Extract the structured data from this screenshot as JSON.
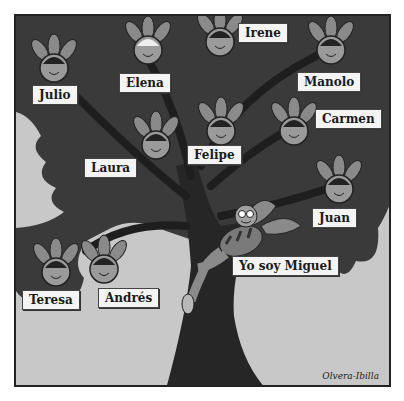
{
  "illustration": {
    "title": "Family tree",
    "colors": {
      "sky": "#c8c8c8",
      "foliage": "#3a3a3a",
      "trunk": "#2a2a2a",
      "leaf": "#8a8a8a",
      "face": "#9a9a9a",
      "label_bg": "#f4f4f4"
    },
    "members": [
      {
        "name": "Julio",
        "face": {
          "cx": 38,
          "cy": 52
        },
        "label": {
          "x": 16,
          "y": 69
        }
      },
      {
        "name": "Elena",
        "face": {
          "cx": 132,
          "cy": 34
        },
        "label": {
          "x": 103,
          "y": 57
        }
      },
      {
        "name": "Irene",
        "face": {
          "cx": 204,
          "cy": 26
        },
        "label": {
          "x": 222,
          "y": 7
        }
      },
      {
        "name": "Manolo",
        "face": {
          "cx": 315,
          "cy": 34
        },
        "label": {
          "x": 281,
          "y": 56
        }
      },
      {
        "name": "Carmen",
        "face": {
          "cx": 278,
          "cy": 115
        },
        "label": {
          "x": 299,
          "y": 93
        }
      },
      {
        "name": "Laura",
        "face": {
          "cx": 140,
          "cy": 129
        },
        "label": {
          "x": 68,
          "y": 142
        }
      },
      {
        "name": "Felipe",
        "face": {
          "cx": 205,
          "cy": 115
        },
        "label": {
          "x": 171,
          "y": 129
        }
      },
      {
        "name": "Juan",
        "face": {
          "cx": 323,
          "cy": 173
        },
        "label": {
          "x": 296,
          "y": 192
        }
      },
      {
        "name": "Teresa",
        "face": {
          "cx": 40,
          "cy": 256
        },
        "label": {
          "x": 6,
          "y": 274
        }
      },
      {
        "name": "Andrés",
        "face": {
          "cx": 88,
          "cy": 253
        },
        "label": {
          "x": 82,
          "y": 272
        }
      }
    ],
    "protagonist": {
      "label": "Yo soy Miguel",
      "label_pos": {
        "x": 216,
        "y": 240
      }
    },
    "signature": "Olvera-Ibilla"
  }
}
